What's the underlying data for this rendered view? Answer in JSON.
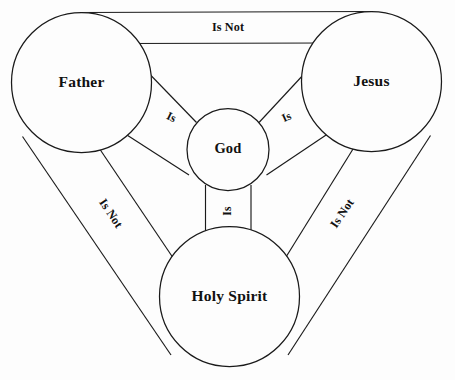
{
  "diagram": {
    "type": "relationship-diagram",
    "background_color": "#fdfdfd",
    "stroke_color": "#1a1a1a",
    "nodes": [
      {
        "id": "father",
        "label": "Father",
        "cx": 81.5,
        "cy": 82.5,
        "r": 70
      },
      {
        "id": "jesus",
        "label": "Jesus",
        "cx": 371.5,
        "cy": 81.5,
        "r": 70
      },
      {
        "id": "holy-spirit",
        "label": "Holy Spirit",
        "cx": 229.5,
        "cy": 296.5,
        "r": 70
      },
      {
        "id": "god",
        "label": "God",
        "cx": 228.0,
        "cy": 149.5,
        "r": 41
      }
    ],
    "edges": [
      {
        "id": "father-jesus",
        "from": "father",
        "to": "jesus",
        "label": "Is Not",
        "rotation": 0
      },
      {
        "id": "father-holy-spirit",
        "from": "father",
        "to": "holy-spirit",
        "label": "Is Not",
        "rotation": 56
      },
      {
        "id": "jesus-holy-spirit",
        "from": "jesus",
        "to": "holy-spirit",
        "label": "Is Not",
        "rotation": -56
      },
      {
        "id": "father-god",
        "from": "father",
        "to": "god",
        "label": "Is",
        "rotation": 25
      },
      {
        "id": "jesus-god",
        "from": "jesus",
        "to": "god",
        "label": "Is",
        "rotation": -25
      },
      {
        "id": "holy-spirit-god",
        "from": "holy-spirit",
        "to": "god",
        "label": "Is",
        "rotation": -90
      }
    ]
  },
  "labels": {
    "top_is_not": "Is Not",
    "left_is_not": "Is Not",
    "right_is_not": "Is Not",
    "left_is": "Is",
    "right_is": "Is",
    "bottom_is": "Is",
    "father": "Father",
    "jesus": "Jesus",
    "holy_spirit": "Holy Spirit",
    "god": "God"
  }
}
